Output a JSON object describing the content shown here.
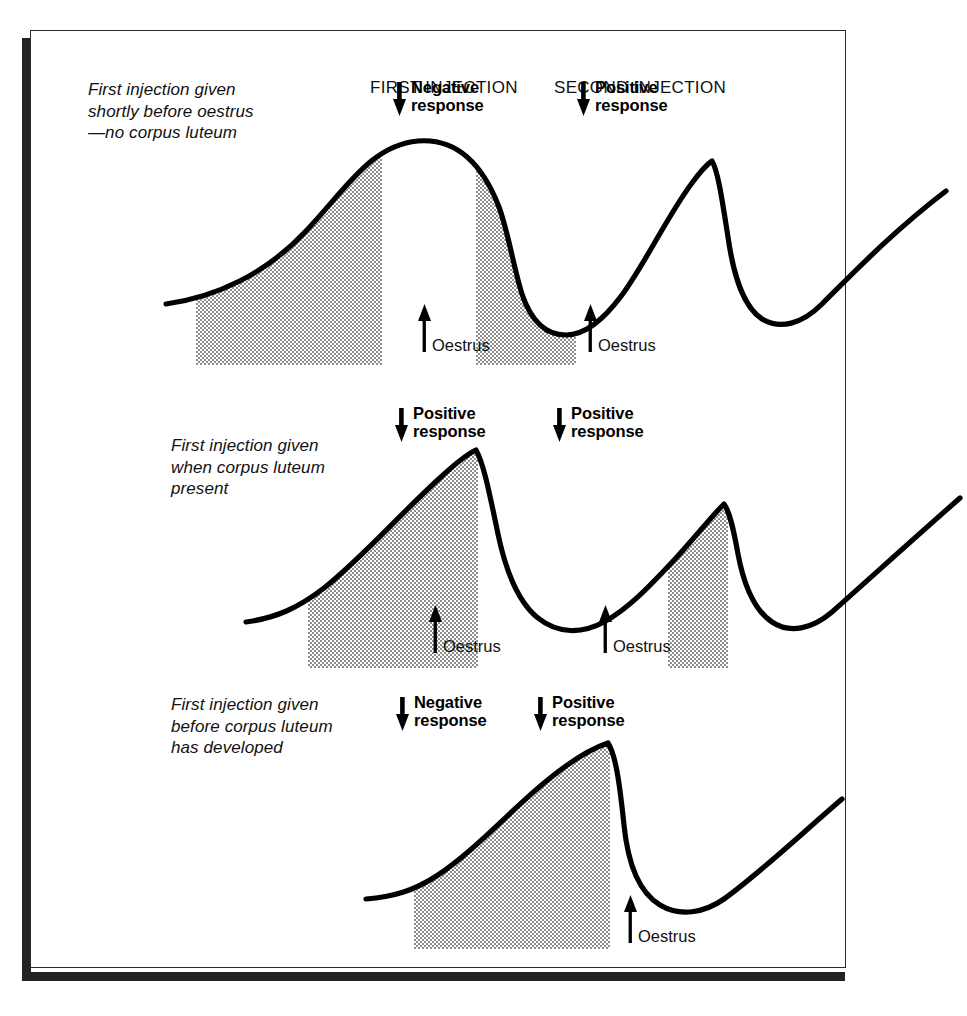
{
  "figure": {
    "headers": [
      {
        "label": "FIRST INJECTION"
      },
      {
        "label": "SECOND INJECTION"
      }
    ],
    "oestrus_label": "Oestrus",
    "colors": {
      "ink": "#000000",
      "frame": "#2b2b2b",
      "shadow": "#232323",
      "shading": "#b9b9b9",
      "background": "#ffffff"
    },
    "icons": {
      "arrow_down": "arrow-down-icon",
      "arrow_up": "arrow-up-icon"
    },
    "panels": [
      {
        "id": "panel-1",
        "caption": "First injection given\nshortly before oestrus\n—no corpus luteum",
        "responses": [
          {
            "label": "Negative\nresponse",
            "type": "negative"
          },
          {
            "label": "Positive\nresponse",
            "type": "positive"
          }
        ],
        "oestrus_markers": 2
      },
      {
        "id": "panel-2",
        "caption": "First injection given\nwhen corpus luteum\npresent",
        "responses": [
          {
            "label": "Positive\nresponse",
            "type": "positive"
          },
          {
            "label": "Positive\nresponse",
            "type": "positive"
          }
        ],
        "oestrus_markers": 2
      },
      {
        "id": "panel-3",
        "caption": "First injection given\nbefore corpus luteum\nhas developed",
        "responses": [
          {
            "label": "Negative\nresponse",
            "type": "negative"
          },
          {
            "label": "Positive\nresponse",
            "type": "positive"
          }
        ],
        "oestrus_markers": 1
      }
    ]
  },
  "chart_data": {
    "type": "line",
    "xlabel": "",
    "ylabel": "",
    "grid": false,
    "legend_position": "none",
    "note": "Three schematic hormone-profile curves; shaded halftone blocks mark the injection-to-oestrus interval. x,y are panel-local SVG coordinates (y grows downward).",
    "panels": [
      {
        "name": "panel-1",
        "curve_path": "M 10,185 C 60,178 110,155 150,112 C 190,70 215,26 262,22 C 300,19 326,44 343,88 C 352,112 358,150 366,175 C 376,205 392,216 410,216 C 430,216 448,200 466,176 C 490,143 512,96 536,64 C 544,53 550,46 556,42 C 562,52 566,80 572,118 C 578,160 588,188 606,200 C 624,211 646,205 666,185 C 700,151 740,110 790,72",
        "shaded_regions": [
          {
            "x0": 40,
            "x1": 226,
            "y_bottom": 246,
            "style": "halftone-50"
          },
          {
            "x0": 320,
            "x1": 420,
            "y_bottom": 246,
            "style": "halftone-50"
          }
        ],
        "oestrus_x": [
          268,
          434
        ],
        "injection_x": [
          226,
          420
        ]
      },
      {
        "name": "panel-2",
        "curve_path": "M 10,186 C 40,182 62,172 88,152 C 126,122 166,76 206,40 C 220,27 232,18 240,14 C 248,28 254,60 262,98 C 270,136 282,166 302,182 C 322,198 346,198 368,186 C 392,173 414,150 440,122 C 460,100 476,80 488,68 C 494,76 498,96 502,118 C 508,150 518,174 536,186 C 554,198 576,193 596,176 C 630,146 676,104 724,62",
        "shaded_regions": [
          {
            "x0": 72,
            "x1": 242,
            "y_bottom": 232,
            "style": "halftone-50"
          },
          {
            "x0": 432,
            "x1": 492,
            "y_bottom": 232,
            "style": "halftone-50"
          }
        ],
        "oestrus_x": [
          326,
          556
        ],
        "injection_x": [
          242,
          492
        ]
      },
      {
        "name": "panel-3",
        "curve_path": "M 10,174 C 36,172 58,166 82,150 C 118,126 152,88 188,58 C 212,38 234,24 252,18 C 260,30 264,62 268,100 C 272,140 284,168 304,180 C 324,192 348,188 368,174 C 404,148 444,110 486,74",
        "shaded_regions": [
          {
            "x0": 58,
            "x1": 254,
            "y_bottom": 224,
            "style": "halftone-50"
          }
        ],
        "oestrus_x": [
          318
        ],
        "injection_x": [
          254
        ]
      }
    ]
  }
}
